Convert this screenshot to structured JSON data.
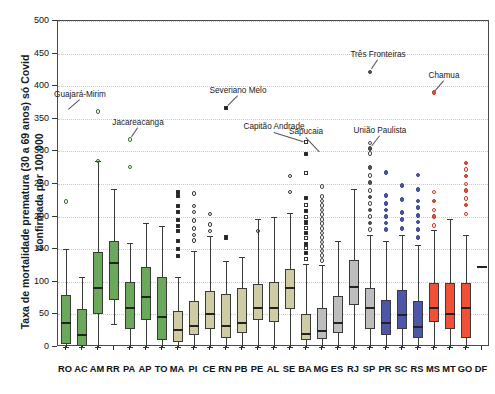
{
  "chart_data": {
    "type": "box",
    "title": "",
    "xlabel": "",
    "ylabel": "Taxa de mortalidade prematura (30 a 69 anos) só Covid\nconfirmada por 100.000",
    "ylim": [
      0,
      500
    ],
    "ytick_values": [
      0,
      50,
      100,
      150,
      200,
      250,
      300,
      350,
      400,
      450,
      500
    ],
    "ytick_labels": [
      "0",
      "50",
      "100",
      "150",
      "200",
      "250",
      "300",
      "350",
      "400",
      "450",
      "500"
    ],
    "grid": true,
    "legend_position": "none",
    "categories": [
      "RO",
      "AC",
      "AM",
      "RR",
      "PA",
      "AP",
      "TO",
      "MA",
      "PI",
      "CE",
      "RN",
      "PB",
      "PE",
      "AL",
      "SE",
      "BA",
      "MG",
      "ES",
      "RJ",
      "SP",
      "PR",
      "SC",
      "RS",
      "MS",
      "MT",
      "GO",
      "DF"
    ],
    "group_colors": {
      "north": "#6aa85c",
      "northeast": "#cfcca4",
      "southeast": "#bdbdbd",
      "south": "#4d57a6",
      "centerwest": "#ef5138",
      "dfline": "#222222"
    },
    "boxes": [
      {
        "cat": "RO",
        "group": "north",
        "color": "#6aa85c",
        "whisker_low": 0,
        "q1": 5,
        "median": 38,
        "q3": 80,
        "whisker_high": 150,
        "outliers": [
          223
        ],
        "outlier_style": "circle-open"
      },
      {
        "cat": "AC",
        "group": "north",
        "color": "#6aa85c",
        "whisker_low": 0,
        "q1": 2,
        "median": 20,
        "q3": 58,
        "whisker_high": 108,
        "outliers": [],
        "outlier_style": "circle-open"
      },
      {
        "cat": "AM",
        "group": "north",
        "color": "#6aa85c",
        "whisker_low": 0,
        "q1": 50,
        "median": 92,
        "q3": 145,
        "whisker_high": 285,
        "outliers": [
          285,
          361
        ],
        "outlier_style": "circle-open"
      },
      {
        "cat": "RR",
        "group": "north",
        "color": "#6aa85c",
        "whisker_low": 36,
        "q1": 72,
        "median": 131,
        "q3": 163,
        "whisker_high": 243,
        "outliers": [],
        "outlier_style": "circle-open"
      },
      {
        "cat": "PA",
        "group": "north",
        "color": "#6aa85c",
        "whisker_low": 0,
        "q1": 28,
        "median": 62,
        "q3": 100,
        "whisker_high": 160,
        "outliers": [
          276,
          318
        ],
        "outlier_style": "circle-open"
      },
      {
        "cat": "AP",
        "group": "north",
        "color": "#6aa85c",
        "whisker_low": 0,
        "q1": 42,
        "median": 78,
        "q3": 122,
        "whisker_high": 190,
        "outliers": [],
        "outlier_style": "circle-open"
      },
      {
        "cat": "TO",
        "group": "north",
        "color": "#6aa85c",
        "whisker_low": 0,
        "q1": 10,
        "median": 48,
        "q3": 108,
        "whisker_high": 185,
        "outliers": [],
        "outlier_style": "circle-open"
      },
      {
        "cat": "MA",
        "group": "northeast",
        "color": "#cfcca4",
        "whisker_low": 0,
        "q1": 8,
        "median": 28,
        "q3": 55,
        "whisker_high": 108,
        "outliers": [
          140,
          150,
          163,
          178,
          186,
          195,
          207,
          216,
          232,
          237
        ],
        "outlier_style": "square-filled"
      },
      {
        "cat": "PI",
        "group": "northeast",
        "color": "#cfcca4",
        "whisker_low": 0,
        "q1": 18,
        "median": 34,
        "q3": 70,
        "whisker_high": 148,
        "outliers": [
          163,
          172,
          182,
          194,
          207,
          216,
          235
        ],
        "outlier_style": "circle-open"
      },
      {
        "cat": "CE",
        "group": "northeast",
        "color": "#cfcca4",
        "whisker_low": 0,
        "q1": 28,
        "median": 52,
        "q3": 86,
        "whisker_high": 170,
        "outliers": [
          178,
          188,
          204
        ],
        "outlier_style": "circle-open"
      },
      {
        "cat": "RN",
        "group": "northeast",
        "color": "#cfcca4",
        "whisker_low": 0,
        "q1": 14,
        "median": 34,
        "q3": 82,
        "whisker_high": 132,
        "outliers": [
          168,
          366
        ],
        "outlier_style": "square-filled"
      },
      {
        "cat": "PB",
        "group": "northeast",
        "color": "#cfcca4",
        "whisker_low": 0,
        "q1": 22,
        "median": 38,
        "q3": 90,
        "whisker_high": 138,
        "outliers": [],
        "outlier_style": "circle-open"
      },
      {
        "cat": "PE",
        "group": "northeast",
        "color": "#cfcca4",
        "whisker_low": 0,
        "q1": 42,
        "median": 62,
        "q3": 96,
        "whisker_high": 196,
        "outliers": [
          178
        ],
        "outlier_style": "circle-open"
      },
      {
        "cat": "AL",
        "group": "northeast",
        "color": "#cfcca4",
        "whisker_low": 0,
        "q1": 38,
        "median": 62,
        "q3": 100,
        "whisker_high": 200,
        "outliers": [],
        "outlier_style": "circle-open"
      },
      {
        "cat": "SE",
        "group": "northeast",
        "color": "#cfcca4",
        "whisker_low": 0,
        "q1": 58,
        "median": 92,
        "q3": 120,
        "whisker_high": 205,
        "outliers": [
          238,
          262
        ],
        "outlier_style": "circle-open"
      },
      {
        "cat": "BA",
        "group": "northeast",
        "color": "#cfcca4",
        "whisker_low": 0,
        "q1": 10,
        "median": 22,
        "q3": 50,
        "whisker_high": 128,
        "outliers": [
          135,
          144,
          152,
          158,
          167,
          175,
          183,
          191,
          200,
          209,
          218,
          228,
          267,
          296,
          314
        ],
        "outlier_style": "square-mixed"
      },
      {
        "cat": "MG",
        "group": "southeast",
        "color": "#bdbdbd",
        "whisker_low": 0,
        "q1": 12,
        "median": 26,
        "q3": 60,
        "whisker_high": 126,
        "outliers": [
          133,
          140,
          147,
          154,
          161,
          168,
          175,
          182,
          189,
          196,
          203,
          210,
          217,
          224,
          231,
          246
        ],
        "outlier_style": "circle-open"
      },
      {
        "cat": "ES",
        "group": "southeast",
        "color": "#bdbdbd",
        "whisker_low": 0,
        "q1": 22,
        "median": 38,
        "q3": 78,
        "whisker_high": 163,
        "outliers": [],
        "outlier_style": "circle-open"
      },
      {
        "cat": "RJ",
        "group": "southeast",
        "color": "#bdbdbd",
        "whisker_low": 0,
        "q1": 64,
        "median": 94,
        "q3": 134,
        "whisker_high": 243,
        "outliers": [],
        "outlier_style": "circle-open"
      },
      {
        "cat": "SP",
        "group": "southeast",
        "color": "#bdbdbd",
        "whisker_low": 0,
        "q1": 28,
        "median": 62,
        "q3": 90,
        "whisker_high": 172,
        "outliers": [
          180,
          190,
          200,
          210,
          220,
          230,
          240,
          252,
          263,
          275,
          297,
          304,
          313,
          422
        ],
        "outlier_style": "circle-mixed"
      },
      {
        "cat": "PR",
        "group": "south",
        "color": "#4d57a6",
        "whisker_low": 0,
        "q1": 18,
        "median": 38,
        "q3": 72,
        "whisker_high": 163,
        "outliers": [
          180,
          190,
          200,
          210,
          220,
          232,
          268
        ],
        "outlier_style": "circle-filled"
      },
      {
        "cat": "SC",
        "group": "south",
        "color": "#4d57a6",
        "whisker_low": 0,
        "q1": 28,
        "median": 50,
        "q3": 88,
        "whisker_high": 172,
        "outliers": [
          182,
          196,
          206,
          226,
          248
        ],
        "outlier_style": "circle-filled"
      },
      {
        "cat": "RS",
        "group": "south",
        "color": "#4d57a6",
        "whisker_low": 0,
        "q1": 14,
        "median": 32,
        "q3": 70,
        "whisker_high": 156,
        "outliers": [
          168,
          180,
          192,
          202,
          214,
          224,
          242,
          264
        ],
        "outlier_style": "circle-filled"
      },
      {
        "cat": "MS",
        "group": "centerwest",
        "color": "#ef5138",
        "whisker_low": 0,
        "q1": 38,
        "median": 62,
        "q3": 98,
        "whisker_high": 180,
        "outliers": [
          186,
          200,
          210,
          224,
          238,
          390
        ],
        "outlier_style": "circle-mixed"
      },
      {
        "cat": "MT",
        "group": "centerwest",
        "color": "#ef5138",
        "whisker_low": 0,
        "q1": 28,
        "median": 52,
        "q3": 98,
        "whisker_high": 196,
        "outliers": [],
        "outlier_style": "circle-filled"
      },
      {
        "cat": "GO",
        "group": "centerwest",
        "color": "#ef5138",
        "whisker_low": 0,
        "q1": 14,
        "median": 62,
        "q3": 98,
        "whisker_high": 172,
        "outliers": [
          204,
          218,
          228,
          240,
          250,
          262,
          272,
          282
        ],
        "outlier_style": "circle-mixed"
      },
      {
        "cat": "DF",
        "group": "dfline",
        "color": "#222222",
        "whisker_low": null,
        "q1": null,
        "median": 125,
        "q3": null,
        "whisker_high": null,
        "outliers": [],
        "outlier_style": "none"
      }
    ],
    "annotations": [
      {
        "label": "Guajará-Mirim",
        "cat": "RO",
        "value": 361,
        "label_dx": 14,
        "label_dy": -13
      },
      {
        "label": "Jacareacanga",
        "cat": "PA",
        "value": 318,
        "label_dx": 8,
        "label_dy": -13
      },
      {
        "label": "Severiano Melo",
        "cat": "RN",
        "value": 366,
        "label_dx": 12,
        "label_dy": -13
      },
      {
        "label": "Capitão Andrade",
        "cat": "BA",
        "value": 314,
        "label_dx": -32,
        "label_dy": -11
      },
      {
        "label": "Sapucaia",
        "cat": "MG",
        "value": 296,
        "label_dx": -16,
        "label_dy": -18
      },
      {
        "label": "União Paulista",
        "cat": "SP",
        "value": 304,
        "label_dx": 10,
        "label_dy": -14
      },
      {
        "label": "Três Fronteiras",
        "cat": "SP",
        "value": 422,
        "label_dx": 8,
        "label_dy": -13
      },
      {
        "label": "Chamua",
        "cat": "MS",
        "value": 390,
        "label_dx": 10,
        "label_dy": -13
      }
    ]
  }
}
